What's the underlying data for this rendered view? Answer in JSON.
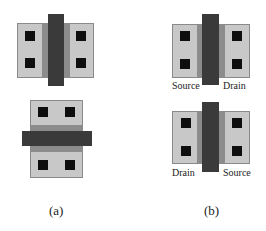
{
  "figure": {
    "panel_a": {
      "caption": "(a)",
      "transistors": [
        {
          "id": "vertical-gate",
          "gate_orientation": "vertical"
        },
        {
          "id": "horizontal-gate",
          "gate_orientation": "horizontal"
        }
      ]
    },
    "panel_b": {
      "caption": "(b)",
      "transistors": [
        {
          "id": "top",
          "left_label": "Source",
          "right_label": "Drain"
        },
        {
          "id": "bottom",
          "left_label": "Drain",
          "right_label": "Source"
        }
      ]
    },
    "colors": {
      "diffusion": "#c8c8c8",
      "channel": "#8c8c8c",
      "gate": "#3a3a3a",
      "contact": "#0e0e0e",
      "background": "#ffffff"
    }
  }
}
